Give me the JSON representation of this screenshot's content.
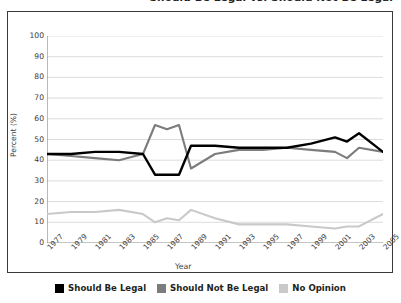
{
  "title": {
    "text": "Should Be Legal vs. Should Not Be Legal",
    "clipped": true
  },
  "axes": {
    "ylabel": "Percent (%)",
    "xlabel": "Year",
    "yticks": [
      "100",
      "90",
      "80",
      "70",
      "60",
      "50",
      "40",
      "30",
      "20",
      "10",
      "0"
    ],
    "xticks": [
      "1977",
      "1979",
      "1981",
      "1983",
      "1985",
      "1987",
      "1989",
      "1991",
      "1993",
      "1995",
      "1997",
      "1999",
      "2001",
      "2003",
      "2005"
    ]
  },
  "legend": {
    "items": [
      {
        "label": "Should Be Legal",
        "color": "#000000"
      },
      {
        "label": "Should Not Be Legal",
        "color": "#7c7c7c"
      },
      {
        "label": "No Opinion",
        "color": "#c9c9c9"
      }
    ]
  },
  "chart_data": {
    "type": "line",
    "title": "Should Be Legal vs. Should Not Be Legal",
    "xlabel": "Year",
    "ylabel": "Percent (%)",
    "ylim": [
      0,
      100
    ],
    "xlim": [
      1977,
      2005
    ],
    "grid": true,
    "legend_position": "bottom",
    "x": [
      1977,
      1979,
      1981,
      1983,
      1985,
      1986,
      1987,
      1988,
      1989,
      1991,
      1993,
      1995,
      1997,
      1999,
      2001,
      2002,
      2003,
      2005
    ],
    "series": [
      {
        "name": "Should Be Legal",
        "color": "#000000",
        "values": [
          43,
          43,
          44,
          44,
          43,
          33,
          33,
          33,
          47,
          47,
          46,
          46,
          46,
          48,
          51,
          49,
          53,
          44
        ]
      },
      {
        "name": "Should Not Be Legal",
        "color": "#7c7c7c",
        "values": [
          43,
          42,
          41,
          40,
          43,
          57,
          55,
          57,
          36,
          43,
          45,
          45,
          46,
          45,
          44,
          41,
          46,
          44
        ]
      },
      {
        "name": "No Opinion",
        "color": "#c9c9c9",
        "values": [
          14,
          15,
          15,
          16,
          14,
          10,
          12,
          11,
          16,
          12,
          9,
          9,
          9,
          8,
          7,
          8,
          8,
          14
        ]
      }
    ]
  }
}
